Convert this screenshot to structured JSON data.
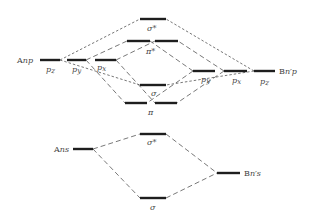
{
  "diagram": {
    "type": "molecular-orbital-diagram",
    "atom_a": {
      "p_label": "Anp",
      "s_label": "Ans",
      "p_orbitals": [
        "p_z",
        "p_y",
        "p_x"
      ]
    },
    "atom_b": {
      "p_label": "Bn′p",
      "s_label": "Bn′s",
      "p_orbitals": [
        "p_y",
        "p_x",
        "p_z"
      ]
    },
    "molecular_orbitals": {
      "p_block": [
        {
          "label": "σ*",
          "role": "antibonding"
        },
        {
          "label": "π*",
          "role": "antibonding"
        },
        {
          "label": "σ",
          "role": "bonding"
        },
        {
          "label": "π",
          "role": "bonding"
        }
      ],
      "s_block": [
        {
          "label": "σ*",
          "role": "antibonding"
        },
        {
          "label": "σ",
          "role": "bonding"
        }
      ]
    },
    "labels": {
      "anp_A": "A",
      "anp_rest": "np",
      "ans_A": "A",
      "ans_rest": "ns",
      "bnp_B": "B",
      "bnp_rest": "n′p",
      "bns_B": "B",
      "bns_rest": "n′s",
      "a_pz": "p",
      "a_pz_sub": "z",
      "a_py": "p",
      "a_py_sub": "y",
      "a_px": "p",
      "a_px_sub": "x",
      "b_py": "p",
      "b_py_sub": "y",
      "b_px": "p",
      "b_px_sub": "x",
      "b_pz": "p",
      "b_pz_sub": "z",
      "sigma_star_p": "σ*",
      "pi_star": "π*",
      "sigma_p": "σ",
      "pi": "π",
      "sigma_star_s": "σ*",
      "sigma_s": "σ"
    }
  }
}
